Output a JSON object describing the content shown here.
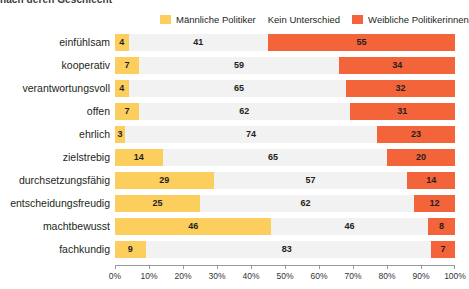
{
  "headline": {
    "text": "nach deren Geschlecht"
  },
  "legend": {
    "position": "top",
    "items": [
      {
        "label": "Männliche Politiker",
        "color": "#fbce5d",
        "swatch": true
      },
      {
        "label": "Kein Unterschied",
        "color": "#f2f2f2",
        "swatch": false
      },
      {
        "label": "Weibliche Politikerinnen",
        "color": "#f4643b",
        "swatch": true
      }
    ]
  },
  "axis": {
    "ticks": [
      "0%",
      "10%",
      "20%",
      "30%",
      "40%",
      "50%",
      "60%",
      "70%",
      "80%",
      "90%",
      "100%"
    ],
    "min": 0,
    "max": 100
  },
  "chart_data": {
    "type": "bar",
    "subtype": "stacked-horizontal-diverging",
    "title": "nach deren Geschlecht",
    "xlabel": "",
    "ylabel": "",
    "xlim": [
      0,
      100
    ],
    "grid": false,
    "legend_position": "top",
    "categories": [
      "einfühlsam",
      "kooperativ",
      "verantwortungsvoll",
      "offen",
      "ehrlich",
      "zielstrebig",
      "durchsetzungsfähig",
      "entscheidungsfreudig",
      "machtbewusst",
      "fachkundig"
    ],
    "series": [
      {
        "name": "Männliche Politiker",
        "color": "#fbce5d",
        "values": [
          4,
          7,
          4,
          7,
          3,
          14,
          29,
          25,
          46,
          9
        ]
      },
      {
        "name": "Kein Unterschied",
        "color": "#f2f2f2",
        "values": [
          41,
          59,
          65,
          62,
          74,
          65,
          57,
          62,
          46,
          83
        ]
      },
      {
        "name": "Weibliche Politikerinnen",
        "color": "#f4643b",
        "values": [
          55,
          34,
          32,
          31,
          23,
          20,
          14,
          12,
          8,
          7
        ]
      }
    ]
  }
}
